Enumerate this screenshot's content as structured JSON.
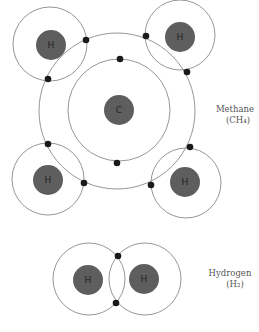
{
  "diagram": {
    "methane": {
      "name": "Methane",
      "formula": "(CH₄)",
      "carbon": {
        "label": "C",
        "inner_shell_electrons": 2,
        "outer_shell_electrons": 8
      },
      "hydrogens": [
        {
          "label": "H",
          "position": "top-left"
        },
        {
          "label": "H",
          "position": "top-right"
        },
        {
          "label": "H",
          "position": "bottom-left"
        },
        {
          "label": "H",
          "position": "bottom-right"
        }
      ]
    },
    "hydrogen": {
      "name": "Hydrogen",
      "formula": "(H₂)",
      "atoms": [
        {
          "label": "H",
          "position": "left"
        },
        {
          "label": "H",
          "position": "right"
        }
      ],
      "shared_electrons": 2
    },
    "colors": {
      "nucleus": "#5e5e5e",
      "electron": "#1a1a1a",
      "orbit": "#8a8a8a"
    }
  }
}
